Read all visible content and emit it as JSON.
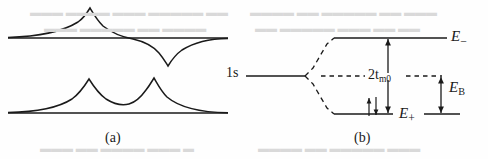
{
  "figure": {
    "caption_a": "(a)",
    "caption_b": "(b)",
    "background_color": "#fefefe",
    "ink_color": "#1a1a1a"
  },
  "panel_a": {
    "name": "wavefunction-panel",
    "upper_curve_name": "antibonding-wavefunction",
    "lower_curve_name": "bonding-wavefunction",
    "upper_baseline_y": 38,
    "lower_baseline_y": 113
  },
  "panel_b": {
    "name": "energy-level-diagram",
    "atomic_level_label": "1s",
    "upper_level_label": "E",
    "upper_level_sign": "−",
    "lower_level_label": "E",
    "lower_level_sign": "+",
    "splitting_label": "2t",
    "splitting_subscript": "m0",
    "binding_label": "E",
    "binding_subscript": "B",
    "levels": {
      "atomic_1s_y": 76,
      "upper_level_y": 38,
      "dashed_center_y": 76,
      "lower_level_y": 114
    }
  }
}
